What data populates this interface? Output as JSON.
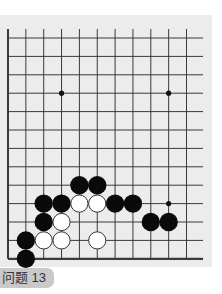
{
  "problem": {
    "label": "问题 13"
  },
  "board": {
    "columns": 11,
    "rows": 13,
    "origin_x": 8,
    "origin_y": 38,
    "spacing_x": 17.85,
    "spacing_y": 18.4,
    "line_extend_top_y": 29,
    "line_extend_right_x": 203,
    "open_edges": [
      "top",
      "right"
    ],
    "closed_edges": [
      "left",
      "bottom"
    ],
    "colors": {
      "background": "#ececec",
      "line": "#3a3a3a",
      "black_stone": "#0a0a0a",
      "white_stone": "#ffffff",
      "white_outline": "#333333"
    },
    "star_points": [
      {
        "col": 3,
        "row": 3
      },
      {
        "col": 9,
        "row": 3
      },
      {
        "col": 9,
        "row": 9
      }
    ],
    "stones": [
      {
        "color": "black",
        "col": 4,
        "row": 8
      },
      {
        "color": "black",
        "col": 5,
        "row": 8
      },
      {
        "color": "black",
        "col": 2,
        "row": 9
      },
      {
        "color": "black",
        "col": 3,
        "row": 9
      },
      {
        "color": "white",
        "col": 4,
        "row": 9
      },
      {
        "color": "white",
        "col": 5,
        "row": 9
      },
      {
        "color": "black",
        "col": 6,
        "row": 9
      },
      {
        "color": "black",
        "col": 7,
        "row": 9
      },
      {
        "color": "black",
        "col": 2,
        "row": 10
      },
      {
        "color": "white",
        "col": 3,
        "row": 10
      },
      {
        "color": "black",
        "col": 8,
        "row": 10
      },
      {
        "color": "black",
        "col": 9,
        "row": 10
      },
      {
        "color": "black",
        "col": 1,
        "row": 11
      },
      {
        "color": "white",
        "col": 2,
        "row": 11
      },
      {
        "color": "white",
        "col": 3,
        "row": 11
      },
      {
        "color": "white",
        "col": 5,
        "row": 11
      },
      {
        "color": "black",
        "col": 1,
        "row": 12
      }
    ]
  }
}
